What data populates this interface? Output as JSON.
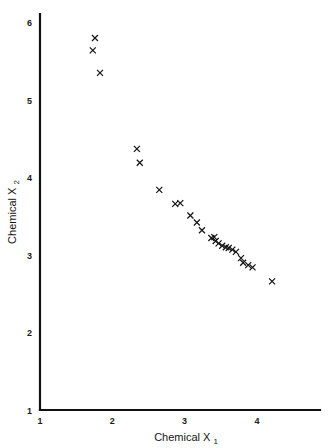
{
  "figure": {
    "background_color": "#ffffff",
    "ink_color": "#151515"
  },
  "chart_data": {
    "type": "scatter",
    "title": "",
    "subtitle": "",
    "xlabel": "Chemical X",
    "xlabel_sub": "1",
    "ylabel": "Chemical X",
    "ylabel_sub": "2",
    "xlim": [
      1,
      4.85
    ],
    "ylim": [
      1,
      6.1
    ],
    "xticks": [
      1,
      2,
      3,
      4
    ],
    "yticks": [
      1,
      2,
      3,
      4,
      5,
      6
    ],
    "xtick_labels": [
      "1",
      "2",
      "3",
      "4"
    ],
    "ytick_labels": [
      "1",
      "2",
      "3",
      "4",
      "5",
      "6"
    ],
    "grid": false,
    "legend": null,
    "legend_position": "none",
    "marker": "x",
    "marker_size": 5,
    "marker_color": "#151515",
    "series": [
      {
        "name": "samples",
        "points": [
          [
            1.76,
            5.8
          ],
          [
            1.73,
            5.64
          ],
          [
            1.83,
            5.35
          ],
          [
            2.34,
            4.37
          ],
          [
            2.38,
            4.19
          ],
          [
            2.65,
            3.84
          ],
          [
            2.87,
            3.66
          ],
          [
            2.94,
            3.67
          ],
          [
            3.08,
            3.51
          ],
          [
            3.17,
            3.42
          ],
          [
            3.24,
            3.32
          ],
          [
            3.37,
            3.22
          ],
          [
            3.41,
            3.23
          ],
          [
            3.43,
            3.18
          ],
          [
            3.47,
            3.15
          ],
          [
            3.52,
            3.12
          ],
          [
            3.57,
            3.1
          ],
          [
            3.61,
            3.09
          ],
          [
            3.66,
            3.07
          ],
          [
            3.71,
            3.04
          ],
          [
            3.78,
            2.96
          ],
          [
            3.81,
            2.9
          ],
          [
            3.88,
            2.87
          ],
          [
            3.94,
            2.84
          ],
          [
            4.21,
            2.66
          ]
        ]
      }
    ]
  },
  "axes": {
    "x_axis_name": "x-axis",
    "y_axis_name": "y-axis"
  }
}
